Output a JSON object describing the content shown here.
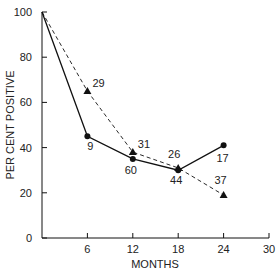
{
  "chart_data": {
    "type": "line",
    "title": "",
    "xlabel": "MONTHS",
    "ylabel": "PER CENT POSITIVE",
    "xlim": [
      0,
      30
    ],
    "ylim": [
      0,
      100
    ],
    "x_ticks": [
      6,
      12,
      18,
      24,
      30
    ],
    "y_ticks": [
      0,
      20,
      40,
      60,
      80,
      100
    ],
    "grid": false,
    "legend": null,
    "series": [
      {
        "name": "solid-circles",
        "style": "solid",
        "marker": "circle",
        "x": [
          0,
          6,
          12,
          18,
          24
        ],
        "values": [
          100,
          45,
          35,
          30,
          41
        ],
        "point_labels": [
          "",
          "9",
          "60",
          "44",
          "17"
        ]
      },
      {
        "name": "dashed-triangles",
        "style": "dashed",
        "marker": "triangle",
        "x": [
          0,
          6,
          12,
          18,
          24
        ],
        "values": [
          100,
          65,
          38,
          31,
          19
        ],
        "point_labels": [
          "",
          "29",
          "31",
          "26",
          "37"
        ]
      }
    ]
  },
  "axes": {
    "xlabel": "MONTHS",
    "ylabel": "PER CENT POSITIVE",
    "x_tick_labels": [
      "6",
      "12",
      "18",
      "24",
      "30"
    ],
    "y_tick_labels": [
      "0",
      "20",
      "40",
      "60",
      "80",
      "100"
    ]
  },
  "colors": {
    "line": "#111111",
    "background": "#ffffff"
  }
}
